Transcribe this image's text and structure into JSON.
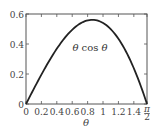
{
  "chart_data": {
    "type": "line",
    "title": "",
    "xlabel": "θ",
    "ylabel": "",
    "xlim": [
      0,
      1.5708
    ],
    "ylim": [
      0,
      0.6
    ],
    "grid": false,
    "x_ticks": [
      "0",
      "0.2",
      "0.4",
      "0.6",
      "0.8",
      "1",
      "1.2",
      "1.4",
      "π/2"
    ],
    "x_tick_values": [
      0,
      0.2,
      0.4,
      0.6,
      0.8,
      1.0,
      1.2,
      1.4,
      1.5708
    ],
    "y_ticks": [
      "0",
      "0.2",
      "0.4",
      "0.6"
    ],
    "y_tick_values": [
      0,
      0.2,
      0.4,
      0.6
    ],
    "annotations": [
      {
        "text": "θ cos θ",
        "x": 0.85,
        "y": 0.45
      }
    ],
    "series": [
      {
        "name": "θ cos θ",
        "x": [
          0,
          0.1,
          0.2,
          0.3,
          0.4,
          0.5,
          0.6,
          0.7,
          0.8,
          0.86,
          0.9,
          1.0,
          1.1,
          1.2,
          1.3,
          1.4,
          1.5,
          1.5708
        ],
        "values": [
          0,
          0.0995,
          0.196,
          0.287,
          0.368,
          0.439,
          0.495,
          0.535,
          0.557,
          0.561,
          0.559,
          0.54,
          0.5,
          0.435,
          0.348,
          0.238,
          0.106,
          0
        ]
      }
    ]
  }
}
